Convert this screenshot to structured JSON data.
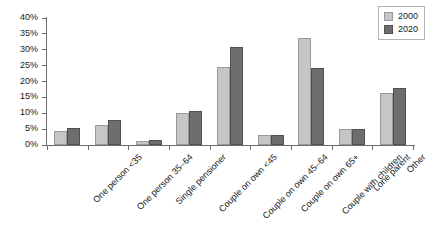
{
  "chart_data": {
    "type": "bar",
    "title": "",
    "subtitle": "",
    "xlabel": "",
    "ylabel": "",
    "ylim": [
      0,
      40
    ],
    "ytick_values": [
      0,
      5,
      10,
      15,
      20,
      25,
      30,
      35,
      40
    ],
    "ytick_labels": [
      "0%",
      "5%",
      "10%",
      "15%",
      "20%",
      "25%",
      "30%",
      "35%",
      "40%"
    ],
    "grid": false,
    "legend_position": "top-right",
    "categories": [
      "One person <35",
      "One person 35–64",
      "Single pensioner",
      "Couple on own <45",
      "Couple on own 45–64",
      "Couple on own 65+",
      "Couple with children",
      "Lone parent",
      "Other"
    ],
    "series": [
      {
        "name": "2000",
        "color": "#c6c6c6",
        "values": [
          4.4,
          6.3,
          1.4,
          10.0,
          24.5,
          3.0,
          33.7,
          5.2,
          16.5
        ]
      },
      {
        "name": "2020",
        "color": "#6e6e6e",
        "values": [
          5.3,
          8.0,
          1.5,
          10.8,
          31.0,
          3.0,
          24.3,
          5.2,
          18.0
        ]
      }
    ]
  },
  "legend": {
    "items": [
      {
        "label": "2000"
      },
      {
        "label": "2020"
      }
    ]
  },
  "colors": {
    "series_2000": "#c6c6c6",
    "series_2020": "#6e6e6e",
    "axis": "#6b6b6b",
    "text": "#1a1a1a",
    "background": "#ffffff"
  }
}
